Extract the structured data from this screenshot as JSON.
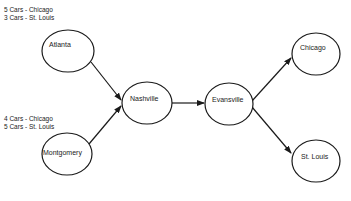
{
  "diagram": {
    "type": "flow-network",
    "stroke_color": "#1a1a1a",
    "background": "#ffffff",
    "nodes": [
      {
        "id": "atlanta",
        "label": "Atlanta",
        "cx": 68,
        "cy": 51,
        "rx": 26,
        "ry": 21
      },
      {
        "id": "montgomery",
        "label": "Montgomery",
        "cx": 67,
        "cy": 154,
        "rx": 25,
        "ry": 21
      },
      {
        "id": "nashville",
        "label": "Nashville",
        "cx": 147,
        "cy": 103,
        "rx": 25,
        "ry": 21
      },
      {
        "id": "evansville",
        "label": "Evansville",
        "cx": 229,
        "cy": 104,
        "rx": 24,
        "ry": 21
      },
      {
        "id": "chicago",
        "label": "Chicago",
        "cx": 316,
        "cy": 54,
        "rx": 24,
        "ry": 21
      },
      {
        "id": "stlouis",
        "label": "St. Louis",
        "cx": 316,
        "cy": 161,
        "rx": 24,
        "ry": 21
      }
    ],
    "edges": [
      {
        "from": "atlanta",
        "to": "nashville"
      },
      {
        "from": "montgomery",
        "to": "nashville"
      },
      {
        "from": "nashville",
        "to": "evansville"
      },
      {
        "from": "evansville",
        "to": "chicago"
      },
      {
        "from": "evansville",
        "to": "stlouis"
      }
    ],
    "supply_notes": {
      "atlanta": {
        "line1": "5 Cars - Chicago",
        "line2": "3 Cars - St. Louis"
      },
      "montgomery": {
        "line1": "4 Cars - Chicago",
        "line2": "5 Cars - St. Louis"
      }
    }
  }
}
